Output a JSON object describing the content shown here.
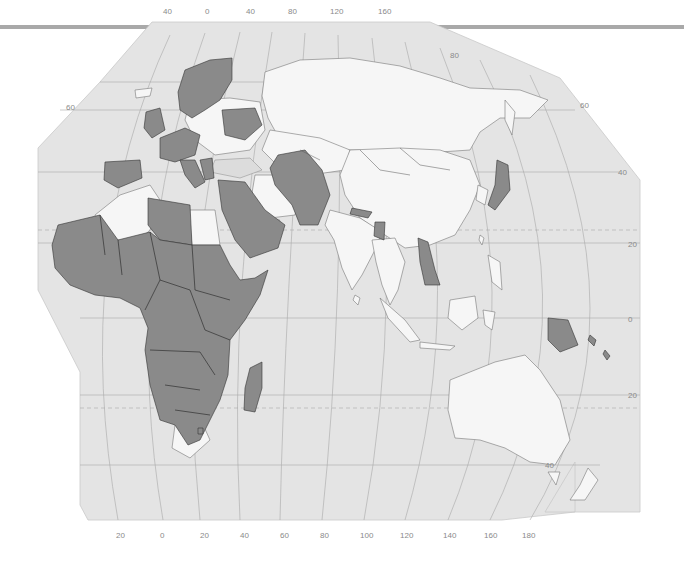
{
  "map": {
    "type": "choropleth",
    "projection": "world-partial-europe-africa-asia-oceania",
    "colors": {
      "ocean": "#e4e4e4",
      "land_default": "#f6f6f6",
      "land_highlighted": "#8a8a8a",
      "graticule": "#a8a8a8",
      "label": "#8a8a8a",
      "top_rule": "#a9a9a9"
    },
    "top_longitude_labels": [
      "40",
      "0",
      "40",
      "80",
      "120",
      "160"
    ],
    "bottom_longitude_labels": [
      "20",
      "0",
      "20",
      "40",
      "60",
      "80",
      "100",
      "120",
      "140",
      "160",
      "180"
    ],
    "latitude_labels_left": [
      "60"
    ],
    "latitude_labels_right": [
      "80",
      "60",
      "40",
      "20",
      "0",
      "20",
      "40"
    ],
    "highlighted_regions": [
      "Norway",
      "Sweden",
      "Finland",
      "United Kingdom",
      "Ireland",
      "France",
      "Spain",
      "Portugal",
      "Belgium",
      "Netherlands",
      "Germany",
      "Denmark",
      "Switzerland",
      "Austria",
      "Italy",
      "Greece",
      "Serbia",
      "Bulgaria",
      "Belarus",
      "Egypt",
      "Libya",
      "Mali",
      "Mauritania",
      "Niger",
      "Chad",
      "Sudan",
      "Nigeria",
      "Senegal",
      "Guinea",
      "Ghana",
      "Cameroon",
      "Central African Republic",
      "DR Congo",
      "Ethiopia",
      "Somalia",
      "Kenya",
      "Tanzania",
      "Uganda",
      "Angola",
      "Zambia",
      "Mozambique",
      "Namibia",
      "Botswana",
      "Zimbabwe",
      "Malawi",
      "Madagascar",
      "Lesotho",
      "Syria",
      "Iraq",
      "Saudi Arabia",
      "Yemen",
      "Oman",
      "Turkmenistan",
      "Uzbekistan",
      "Tajikistan",
      "Afghanistan",
      "Pakistan",
      "Nepal",
      "Bangladesh",
      "Laos",
      "Cambodia",
      "Japan",
      "Papua New Guinea",
      "Solomon Islands"
    ]
  }
}
